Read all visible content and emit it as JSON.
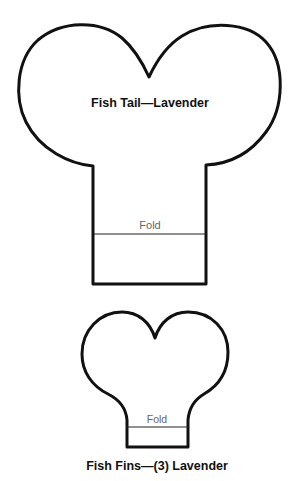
{
  "patterns": [
    {
      "name": "Fish Tail",
      "label": "Fish Tail—Lavender",
      "color": "Lavender",
      "quantity": 1,
      "fold_label": "Fold"
    },
    {
      "name": "Fish Fins",
      "label": "Fish Fins—(3) Lavender",
      "color": "Lavender",
      "quantity": 3,
      "fold_label": "Fold"
    }
  ],
  "colors": {
    "outline": "#111111",
    "fold_text": "#666666",
    "background": "#ffffff"
  }
}
